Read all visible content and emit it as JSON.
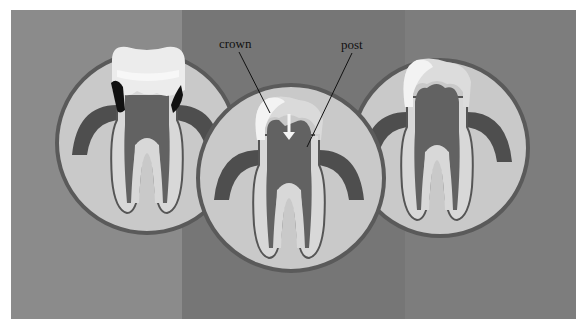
{
  "figure": {
    "labels": {
      "crown": "crown",
      "post": "post"
    },
    "panels": [
      {
        "id": "left",
        "state": "damaged tooth with decay",
        "bg": "#8b8b8b"
      },
      {
        "id": "middle",
        "state": "post inserted, crown being placed",
        "bg": "#767676"
      },
      {
        "id": "right",
        "state": "restored tooth with crown",
        "bg": "#7d7d7d"
      }
    ],
    "colors": {
      "circle_fill": "#c9c9c9",
      "circle_stroke": "#5a5a5a",
      "gum": "#4e4e4e",
      "tooth": "#d8d8d8",
      "pulp": "#626262",
      "crown": "#ececec",
      "decay": "#111111"
    }
  }
}
